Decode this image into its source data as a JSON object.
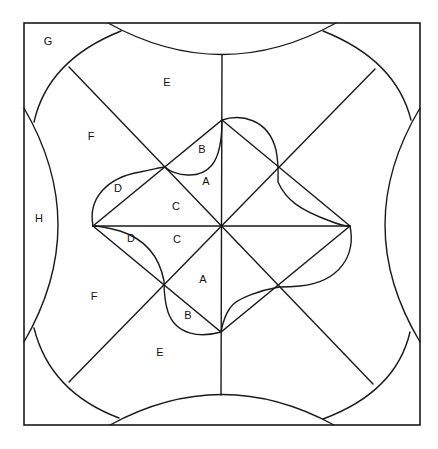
{
  "diagram": {
    "type": "quilt-block-pattern",
    "stroke_color": "#1a1a1a",
    "background": "#ffffff",
    "labels": [
      {
        "text": "G",
        "x": 48,
        "y": 42
      },
      {
        "text": "E",
        "x": 167,
        "y": 83
      },
      {
        "text": "F",
        "x": 91,
        "y": 137
      },
      {
        "text": "B",
        "x": 202,
        "y": 150
      },
      {
        "text": "A",
        "x": 206,
        "y": 182
      },
      {
        "text": "D",
        "x": 118,
        "y": 189
      },
      {
        "text": "C",
        "x": 176,
        "y": 207
      },
      {
        "text": "H",
        "x": 39,
        "y": 219
      },
      {
        "text": "D",
        "x": 131,
        "y": 239
      },
      {
        "text": "C",
        "x": 177,
        "y": 240
      },
      {
        "text": "A",
        "x": 203,
        "y": 280
      },
      {
        "text": "F",
        "x": 94,
        "y": 297
      },
      {
        "text": "B",
        "x": 188,
        "y": 316
      },
      {
        "text": "E",
        "x": 160,
        "y": 353
      }
    ]
  }
}
